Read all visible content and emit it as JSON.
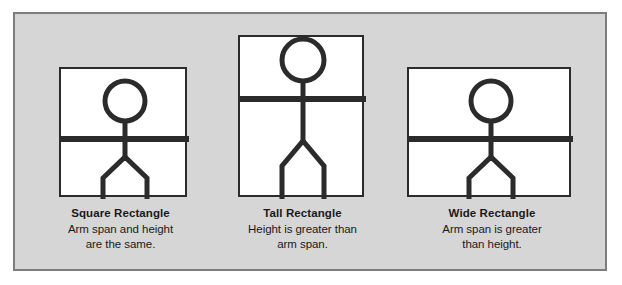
{
  "diagram": {
    "background_color": "#d6d6d6",
    "panel_border_color": "#7d7d7d",
    "box_fill_color": "#ffffff",
    "stroke_color": "#2b2b2b",
    "figures": [
      {
        "id": "square-rectangle",
        "box_shape": "square",
        "box_width": 128,
        "box_height": 129,
        "caption_title": "Square Rectangle",
        "caption_line1": "Arm span and height",
        "caption_line2": "are the same.",
        "icon": "stick-figure-icon"
      },
      {
        "id": "tall-rectangle",
        "box_shape": "tall",
        "box_width": 124,
        "box_height": 162,
        "caption_title": "Tall Rectangle",
        "caption_line1": "Height is greater than",
        "caption_line2": "arm span.",
        "icon": "stick-figure-icon"
      },
      {
        "id": "wide-rectangle",
        "box_shape": "wide",
        "box_width": 163,
        "box_height": 129,
        "caption_title": "Wide Rectangle",
        "caption_line1": "Arm span is greater",
        "caption_line2": "than height.",
        "icon": "stick-figure-icon"
      }
    ]
  }
}
